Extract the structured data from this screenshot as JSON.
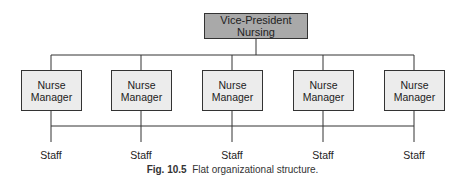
{
  "top_node": {
    "label": "Vice-President Nursing"
  },
  "managers": [
    {
      "line1": "Nurse",
      "line2": "Manager"
    },
    {
      "line1": "Nurse",
      "line2": "Manager"
    },
    {
      "line1": "Nurse",
      "line2": "Manager"
    },
    {
      "line1": "Nurse",
      "line2": "Manager"
    },
    {
      "line1": "Nurse",
      "line2": "Manager"
    }
  ],
  "staff": [
    "Staff",
    "Staff",
    "Staff",
    "Staff",
    "Staff"
  ],
  "caption": {
    "number": "Fig. 10.5",
    "text": "Flat organizational structure."
  },
  "colors": {
    "top_fill": "#a9a9a9",
    "manager_fill": "#ececec",
    "line": "#333333"
  }
}
